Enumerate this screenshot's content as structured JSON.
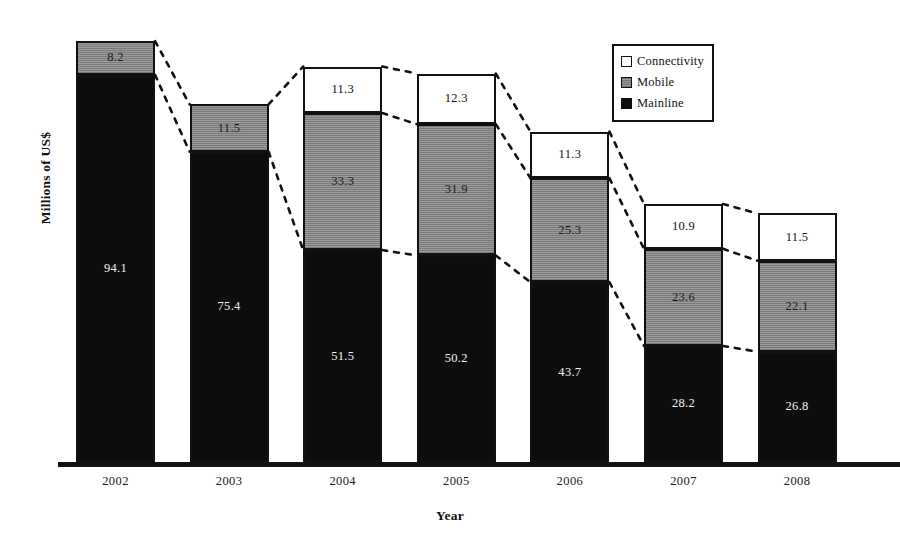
{
  "chart_data": {
    "type": "bar",
    "subtype": "stacked-bar",
    "title": "",
    "xlabel": "Year",
    "ylabel": "Millions of US$",
    "categories": [
      "2002",
      "2003",
      "2004",
      "2005",
      "2006",
      "2007",
      "2008"
    ],
    "series": [
      {
        "name": "Mainline",
        "values": [
          94.1,
          75.4,
          51.5,
          50.2,
          43.7,
          28.2,
          26.8
        ]
      },
      {
        "name": "Mobile",
        "values": [
          8.2,
          11.5,
          33.3,
          31.9,
          25.3,
          23.6,
          22.1
        ]
      },
      {
        "name": "Connectivity",
        "values": [
          null,
          null,
          11.3,
          12.3,
          11.3,
          10.9,
          11.5
        ]
      }
    ],
    "totals": [
      102.3,
      86.9,
      96.1,
      94.4,
      80.3,
      62.7,
      60.4
    ],
    "stack_order_bottom_to_top": [
      "Mainline",
      "Mobile",
      "Connectivity"
    ],
    "data_labels_shown": true,
    "grid": false,
    "yaxis_ticks_shown": false,
    "ylim": [
      0,
      102.3
    ],
    "legend_position": "top-right",
    "annotations": "Dashed connector lines join matching segment boundaries between adjacent bars",
    "colors": {
      "mainline": "#0d0d0d",
      "mobile": "#9c9c9c",
      "connectivity": "#ffffff",
      "outline": "#111111",
      "background": "#ffffff"
    }
  },
  "legend": {
    "items": [
      {
        "label": "Connectivity",
        "swatch": "connectivity-swatch"
      },
      {
        "label": "Mobile",
        "swatch": "mobile-swatch"
      },
      {
        "label": "Mainline",
        "swatch": "mainline-swatch"
      }
    ]
  },
  "axes": {
    "x_title": "Year",
    "y_title": "Millions of US$"
  }
}
